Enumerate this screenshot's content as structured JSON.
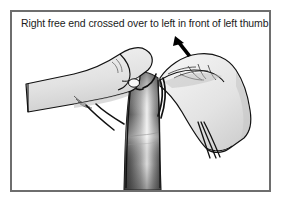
{
  "figure": {
    "caption": "Right free end crossed over to left in front of left thumb",
    "alt_description": "Line drawing of two hands tying a knot: the left hand pinches a strand while the right hand carries the right free end across to the left in front of the left thumb, with a dark vertical tie band hanging between them.",
    "frame": {
      "border_color": "#6e6e6e",
      "background_color": "#ffffff"
    },
    "colors": {
      "outline": "#111111",
      "hand_fill_light": "#ededed",
      "hand_fill_shade": "#c9c9c9",
      "band_dark": "#4a4a4a",
      "band_darkest": "#2b2b2b",
      "band_highlight": "#f2f2f2",
      "thread": "#111111",
      "arrow": "#000000",
      "text": "#1b1b1b"
    },
    "elements": [
      {
        "name": "left-hand",
        "label": "Left hand"
      },
      {
        "name": "right-hand",
        "label": "Right hand"
      },
      {
        "name": "tie-band",
        "label": "Tie band"
      },
      {
        "name": "suture-strand",
        "label": "Suture strand"
      },
      {
        "name": "direction-arrow",
        "label": "Direction of movement"
      }
    ]
  }
}
